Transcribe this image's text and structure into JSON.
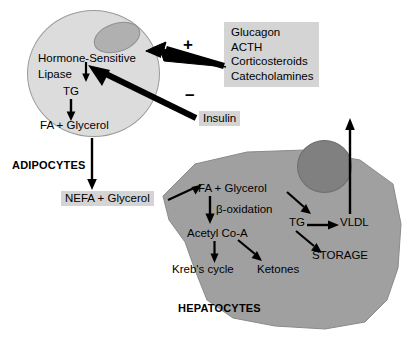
{
  "diagram": {
    "title_adipocytes": "ADIPOCYTES",
    "title_hepatocytes": "HEPATOCYTES"
  },
  "adipocyte": {
    "enzyme_line1": "Hormone-Sensitive",
    "enzyme_line2": "Lipase",
    "substrate": "TG",
    "products": "FA + Glycerol"
  },
  "hormones": {
    "plus_sign": "+",
    "minus_sign": "–",
    "stimulatory": [
      {
        "label": "Glucagon"
      },
      {
        "label": "ACTH"
      },
      {
        "label": "Corticosteroids"
      },
      {
        "label": "Catecholamines"
      }
    ],
    "inhibitory": "Insulin"
  },
  "circulation": {
    "nefa": "NEFA + Glycerol"
  },
  "hepatocyte": {
    "uptake": "FA  +  Glycerol",
    "beta_oxidation": "β-oxidation",
    "acetyl_coa": "Acetyl Co-A",
    "krebs": "Kreb's cycle",
    "ketones": "Ketones",
    "tg": "TG",
    "vldl": "VLDL",
    "storage": "STORAGE"
  },
  "colors": {
    "adipocyte_fill": "#dcdcdc",
    "adipocyte_nucleus": "#b0b0b0",
    "hepatocyte_fill": "#a0a0a0",
    "hepatocyte_nucleus": "#808080",
    "label_box": "#d4d4d4",
    "arrow": "#000000"
  }
}
